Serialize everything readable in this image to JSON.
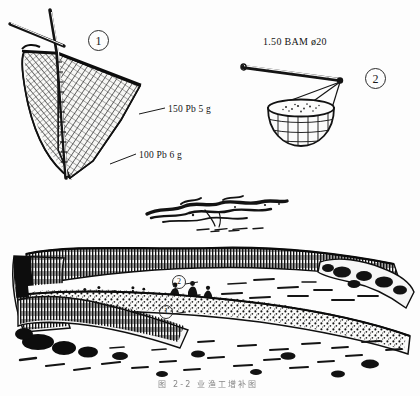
{
  "page": {
    "background_color": "#fdfdfd",
    "ink_color": "#141414",
    "caption": "图 2-2  业渔工增补图"
  },
  "figures": [
    {
      "id": "fig-1",
      "marker": "1",
      "name": "dip-net-scoop-net",
      "marker_position": {
        "x": 88,
        "y": 30
      },
      "labels": [
        {
          "name": "mesh-upper-spec",
          "text": "150 Pb 5 g",
          "position": {
            "x": 168,
            "y": 104
          },
          "leader_from": {
            "x": 139,
            "y": 114
          },
          "leader_to": {
            "x": 165,
            "y": 108
          }
        },
        {
          "name": "mesh-lower-spec",
          "text": "100 Pb 6 g",
          "position": {
            "x": 139,
            "y": 150
          },
          "leader_from": {
            "x": 110,
            "y": 164
          },
          "leader_to": {
            "x": 136,
            "y": 154
          }
        }
      ]
    },
    {
      "id": "fig-2",
      "marker": "2",
      "name": "hanging-basket-on-pole",
      "marker_position": {
        "x": 365,
        "y": 68
      },
      "labels": [
        {
          "name": "pole-dimension-spec",
          "text": "1.50 BAM ø20",
          "position": {
            "x": 263,
            "y": 36
          }
        }
      ]
    },
    {
      "id": "fig-3",
      "marker": "",
      "name": "shoreline-vignette-sketch",
      "labels": []
    },
    {
      "id": "fig-4",
      "marker": "",
      "name": "beach-scene-panorama",
      "labels": [],
      "scene_markers": [
        {
          "name": "scene-marker-2",
          "text": "2",
          "position": {
            "x": 172,
            "y": 281
          }
        },
        {
          "name": "scene-marker-1",
          "text": "1",
          "position": {
            "x": 159,
            "y": 311
          }
        }
      ]
    }
  ]
}
